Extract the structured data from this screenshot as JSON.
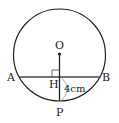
{
  "diagram": {
    "points": {
      "O": "O",
      "A": "A",
      "B": "B",
      "H": "H",
      "P": "P"
    },
    "measure": "4cm",
    "colors": {
      "stroke": "#222222",
      "arc": "#999999",
      "background": "#ffffff"
    }
  }
}
